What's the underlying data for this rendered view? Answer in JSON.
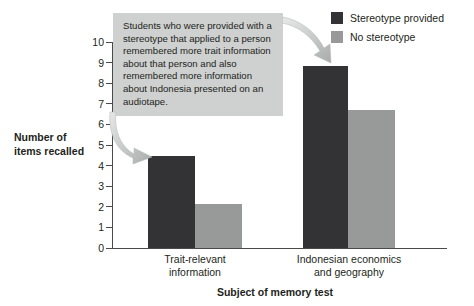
{
  "chart_data": {
    "type": "bar",
    "title": "",
    "xlabel": "Subject of memory test",
    "ylabel": "Number of\nitems recalled",
    "categories": [
      "Trait-relevant\ninformation",
      "Indonesian economics\nand geography"
    ],
    "series": [
      {
        "name": "Stereotype provided",
        "color": "#333234",
        "values": [
          4.45,
          8.85
        ]
      },
      {
        "name": "No stereotype",
        "color": "#989a99",
        "values": [
          2.15,
          6.7
        ]
      }
    ],
    "ylim": [
      0,
      10
    ],
    "yticks": [
      10,
      9,
      8,
      7,
      6,
      5,
      4,
      3,
      2,
      1,
      0
    ],
    "grid": false,
    "legend_position": "top-right",
    "annotations": [
      {
        "text": "Students who were provided with a stereotype that applied to a person remembered more trait information about that person and also remembered more information about Indonesia presented on an audiotape.",
        "background": "#cfd1d0"
      }
    ]
  },
  "axes": {
    "y_title_line1": "Number of",
    "y_title_line2": "items recalled",
    "x_title": "Subject of memory test",
    "y_tick_labels": [
      "10",
      "9",
      "8",
      "7",
      "6",
      "5",
      "4",
      "3",
      "2",
      "1",
      "0"
    ],
    "category_labels": [
      {
        "line1": "Trait-relevant",
        "line2": "information"
      },
      {
        "line1": "Indonesian economics",
        "line2": "and geography"
      }
    ]
  },
  "legend": {
    "items": [
      {
        "label": "Stereotype provided",
        "color": "#333234"
      },
      {
        "label": "No stereotype",
        "color": "#989a99"
      }
    ]
  },
  "callout": {
    "text": "Students who were provided with a stereotype that applied to a person remembered more trait information about that person and also remembered more information about Indonesia presented on an audiotape."
  }
}
